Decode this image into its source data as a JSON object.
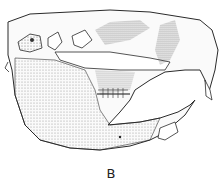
{
  "figure": {
    "label": "B"
  },
  "colors": {
    "ink": "#2a2a2a",
    "background": "#ffffff"
  }
}
